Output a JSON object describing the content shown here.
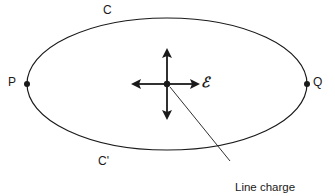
{
  "figure": {
    "type": "physics-diagram",
    "background_color": "#ffffff",
    "stroke_color": "#1a1a1a",
    "curve": {
      "shape": "ellipse",
      "center_x": 167,
      "center_y": 84,
      "radius_x": 140,
      "radius_y": 66
    },
    "labels": {
      "top_curve": "C",
      "bottom_curve": "C'",
      "left_point": "P",
      "right_point": "Q",
      "field_symbol": "ℰ"
    },
    "caption": {
      "line1": "Line charge",
      "line2": "normal to page"
    },
    "arrows": {
      "description": "four-way-arrow-cross",
      "directions": [
        "up",
        "down",
        "left",
        "right"
      ],
      "center_x": 167,
      "center_y": 84,
      "up_tip_y": 50,
      "down_tip_y": 118,
      "left_tip_x": 133,
      "right_tip_x": 198
    },
    "markers": {
      "point_p_x": 27,
      "point_p_y": 84,
      "point_q_x": 307,
      "point_q_y": 84,
      "center_dot_x": 167,
      "center_dot_y": 84
    },
    "leader_line": {
      "from_x": 169,
      "from_y": 86,
      "to_x": 229,
      "to_y": 160
    }
  }
}
